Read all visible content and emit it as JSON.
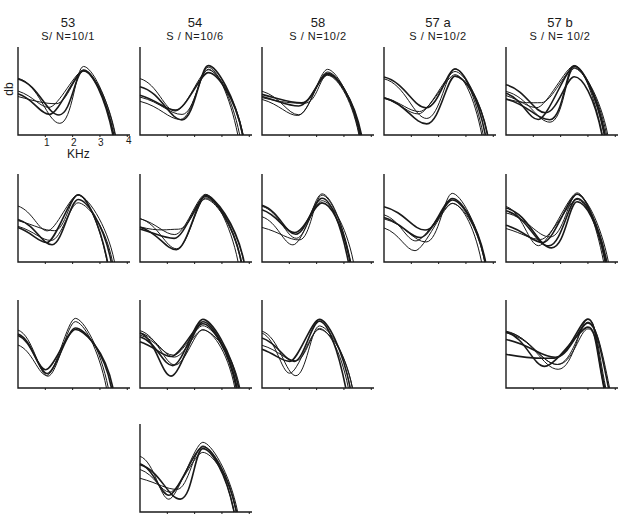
{
  "chart_data": {
    "type": "line",
    "title": "",
    "xlabel": "KHz",
    "ylabel": "db",
    "x_ticks": [
      "1",
      "2",
      "3",
      "4"
    ],
    "xlim": [
      0,
      4
    ],
    "columns": [
      {
        "id": "53",
        "sn": "S/ N=10/1"
      },
      {
        "id": "54",
        "sn": "S / N=10/6"
      },
      {
        "id": "58",
        "sn": "S / N=10/2"
      },
      {
        "id": "57 a",
        "sn": "S / N=10/2"
      },
      {
        "id": "57 b",
        "sn": "S / N= 10/2"
      }
    ],
    "panels": [
      {
        "col": 0,
        "row": 0,
        "traces": 5,
        "peak_khz": 2.4
      },
      {
        "col": 1,
        "row": 0,
        "traces": 5,
        "peak_khz": 2.5
      },
      {
        "col": 2,
        "row": 0,
        "traces": 5,
        "peak_khz": 2.4
      },
      {
        "col": 3,
        "row": 0,
        "traces": 5,
        "peak_khz": 2.6
      },
      {
        "col": 4,
        "row": 0,
        "traces": 6,
        "peak_khz": 2.5
      },
      {
        "col": 0,
        "row": 1,
        "traces": 5,
        "peak_khz": 2.2
      },
      {
        "col": 1,
        "row": 1,
        "traces": 5,
        "peak_khz": 2.4
      },
      {
        "col": 2,
        "row": 1,
        "traces": 5,
        "peak_khz": 2.2
      },
      {
        "col": 3,
        "row": 1,
        "traces": 5,
        "peak_khz": 2.5
      },
      {
        "col": 4,
        "row": 1,
        "traces": 6,
        "peak_khz": 2.6
      },
      {
        "col": 0,
        "row": 2,
        "traces": 4,
        "peak_khz": 2.1
      },
      {
        "col": 1,
        "row": 2,
        "traces": 6,
        "peak_khz": 2.3
      },
      {
        "col": 2,
        "row": 2,
        "traces": 5,
        "peak_khz": 2.1
      },
      {
        "col": 4,
        "row": 2,
        "traces": 6,
        "peak_khz": 3.0
      },
      {
        "col": 1,
        "row": 3,
        "traces": 5,
        "peak_khz": 2.3
      }
    ]
  },
  "labels": {
    "ylabel": "db",
    "xlabel": "KHz",
    "ticks": [
      "1",
      "2",
      "3",
      "4"
    ]
  }
}
